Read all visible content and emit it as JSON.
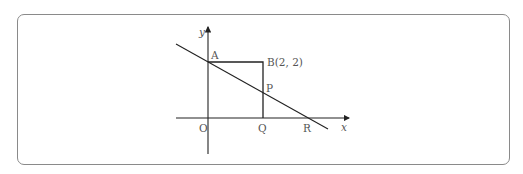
{
  "diagram": {
    "axes": {
      "x_label": "x",
      "y_label": "y",
      "origin_label": "O"
    },
    "points": {
      "A": {
        "label": "A"
      },
      "B": {
        "label": "B(2, 2)"
      },
      "P": {
        "label": "P"
      },
      "Q": {
        "label": "Q"
      },
      "R": {
        "label": "R"
      }
    },
    "colors": {
      "line": "#222222",
      "text": "#555555",
      "frame": "#8a8a8a"
    }
  }
}
